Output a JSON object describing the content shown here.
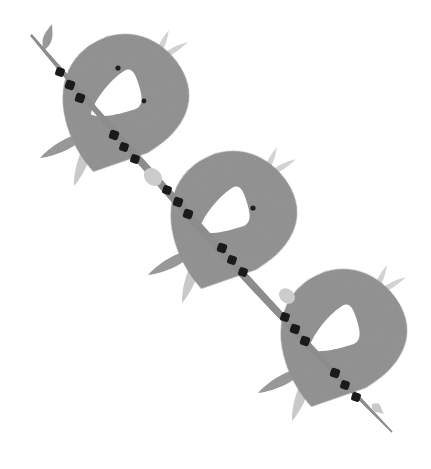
{
  "artwork": {
    "title": "Three Birds on a Berry Branch",
    "type": "decorative-illustration",
    "style": "flat vector, monochrome grayscale, hand-drawn folk art",
    "canvas": {
      "width": 431,
      "height": 469,
      "background": "#ffffff"
    },
    "orientation": "diagonal from top-left to bottom-right",
    "motif_count": 3
  },
  "palette": {
    "background": "#ffffff",
    "body_gray": "#8f8f8f",
    "body_gray_shade": "#8a8a8a",
    "stem_gray": "#8a8a8a",
    "leaf_mid_gray": "#969696",
    "leaf_light_gray": "#c9c9c9",
    "tail_light_gray": "#d2d2d2",
    "bud_light_gray": "#cccccc",
    "berry_black": "#1a1a1a",
    "eye_black": "#1f1f1f",
    "wing_white": "#ffffff"
  },
  "elements": {
    "stem_label": "diagonal branch stem",
    "berry_label": "dark berry bead",
    "leaf_label": "branch leaf",
    "bud_label": "stem bud node",
    "bird_label": "stylized bird body",
    "wing_label": "white triangular wing",
    "eye_label": "bird eye dot",
    "tail_label": "tail feather"
  },
  "birds": [
    {
      "index": 1,
      "name": "bird-top-left",
      "body": {
        "cx": 120,
        "cy": 95,
        "rx": 62,
        "ry": 58,
        "rotation": -32
      },
      "wing": {
        "x": 86,
        "y": 78,
        "w": 56,
        "h": 40
      },
      "eyes": [
        {
          "cx": 118,
          "cy": 68,
          "r": 2.6
        },
        {
          "cx": 144,
          "cy": 101,
          "r": 2.4
        }
      ],
      "tail_feathers": [
        {
          "x1": 157,
          "y1": 56,
          "x2": 169,
          "y2": 30,
          "w": 7
        },
        {
          "x1": 160,
          "y1": 58,
          "x2": 188,
          "y2": 42,
          "w": 7
        }
      ],
      "leaves": [
        {
          "x1": 88,
          "y1": 133,
          "x2": 40,
          "y2": 158,
          "w": 13,
          "tone": "mid"
        },
        {
          "x1": 92,
          "y1": 136,
          "x2": 74,
          "y2": 186,
          "w": 13,
          "tone": "light"
        }
      ]
    },
    {
      "index": 2,
      "name": "bird-middle",
      "body": {
        "cx": 228,
        "cy": 212,
        "rx": 62,
        "ry": 58,
        "rotation": -32
      },
      "wing": {
        "x": 194,
        "y": 195,
        "w": 56,
        "h": 40
      },
      "eyes": [
        {
          "cx": 253,
          "cy": 208,
          "r": 2.6
        }
      ],
      "tail_feathers": [
        {
          "x1": 265,
          "y1": 173,
          "x2": 277,
          "y2": 147,
          "w": 7
        },
        {
          "x1": 268,
          "y1": 175,
          "x2": 296,
          "y2": 159,
          "w": 7
        }
      ],
      "leaves": [
        {
          "x1": 196,
          "y1": 250,
          "x2": 148,
          "y2": 275,
          "w": 13,
          "tone": "mid"
        },
        {
          "x1": 200,
          "y1": 253,
          "x2": 182,
          "y2": 303,
          "w": 13,
          "tone": "light"
        }
      ]
    },
    {
      "index": 3,
      "name": "bird-bottom-right",
      "body": {
        "cx": 338,
        "cy": 330,
        "rx": 62,
        "ry": 58,
        "rotation": -32
      },
      "wing": {
        "x": 304,
        "y": 313,
        "w": 56,
        "h": 40
      },
      "eyes": [],
      "tail_feathers": [
        {
          "x1": 375,
          "y1": 291,
          "x2": 387,
          "y2": 265,
          "w": 7
        },
        {
          "x1": 378,
          "y1": 293,
          "x2": 406,
          "y2": 277,
          "w": 7
        }
      ],
      "leaves": [
        {
          "x1": 306,
          "y1": 368,
          "x2": 258,
          "y2": 393,
          "w": 13,
          "tone": "mid"
        },
        {
          "x1": 310,
          "y1": 371,
          "x2": 292,
          "y2": 421,
          "w": 13,
          "tone": "light"
        }
      ]
    }
  ],
  "stem": {
    "path": "M 31 35 L 390 428",
    "top_tip": {
      "x": 31,
      "y": 35
    },
    "bottom_tip": {
      "x": 392,
      "y": 432
    },
    "width_max": 9,
    "top_leaf": {
      "x1": 44,
      "y1": 50,
      "x2": 52,
      "y2": 24,
      "w": 11
    },
    "bottom_leaf": {
      "x1": 372,
      "y1": 404,
      "x2": 384,
      "y2": 414,
      "w": 11
    },
    "buds": [
      {
        "cx": 153,
        "cy": 177,
        "r": 8
      },
      {
        "cx": 287,
        "cy": 296,
        "r": 7
      }
    ]
  },
  "berries": [
    {
      "cx": 60,
      "cy": 72,
      "r": 4.4
    },
    {
      "cx": 70,
      "cy": 85,
      "r": 4.6
    },
    {
      "cx": 80,
      "cy": 98,
      "r": 4.6
    },
    {
      "cx": 114,
      "cy": 135,
      "r": 4.6
    },
    {
      "cx": 124,
      "cy": 147,
      "r": 4.4
    },
    {
      "cx": 135,
      "cy": 159,
      "r": 4.4
    },
    {
      "cx": 167,
      "cy": 190,
      "r": 4.4
    },
    {
      "cx": 178,
      "cy": 202,
      "r": 4.6
    },
    {
      "cx": 188,
      "cy": 214,
      "r": 4.6
    },
    {
      "cx": 222,
      "cy": 248,
      "r": 4.6
    },
    {
      "cx": 232,
      "cy": 260,
      "r": 4.4
    },
    {
      "cx": 243,
      "cy": 272,
      "r": 4.4
    },
    {
      "cx": 285,
      "cy": 317,
      "r": 4.4
    },
    {
      "cx": 295,
      "cy": 329,
      "r": 4.6
    },
    {
      "cx": 305,
      "cy": 341,
      "r": 4.6
    },
    {
      "cx": 335,
      "cy": 373,
      "r": 4.6
    },
    {
      "cx": 345,
      "cy": 385,
      "r": 4.4
    },
    {
      "cx": 356,
      "cy": 397,
      "r": 4.4
    }
  ]
}
